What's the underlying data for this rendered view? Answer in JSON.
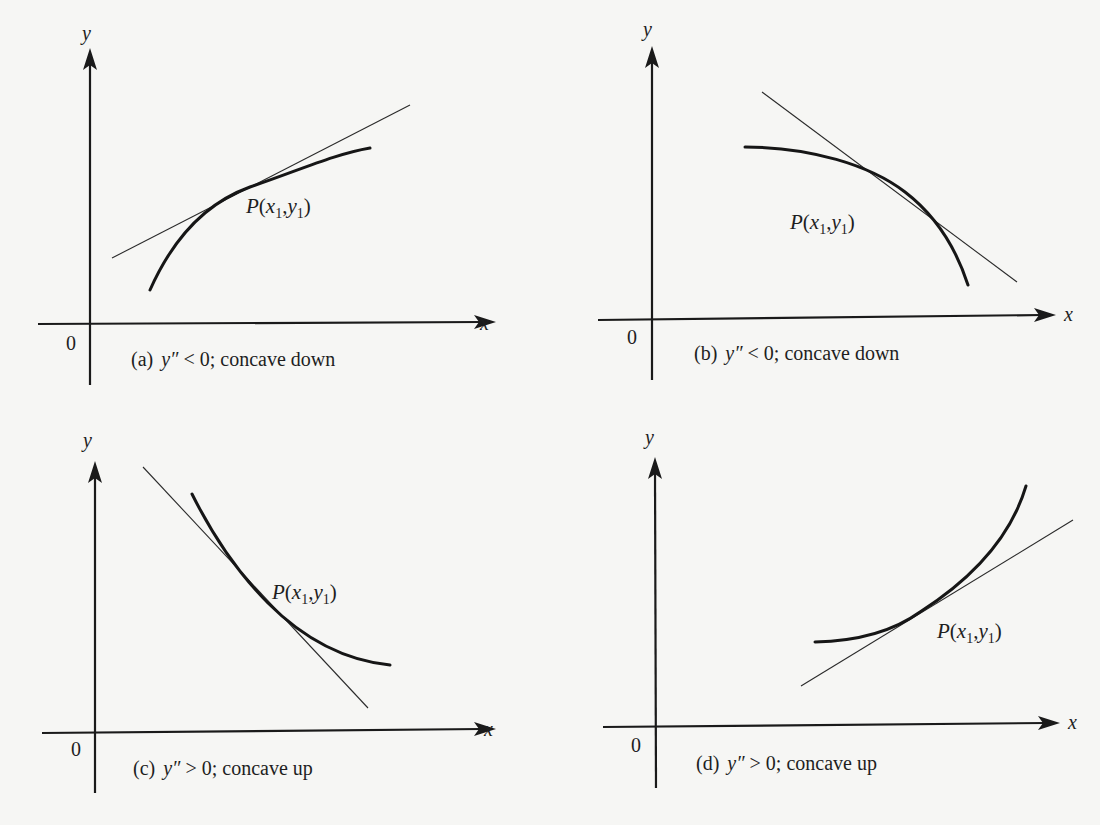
{
  "figure": {
    "panels": [
      {
        "id": "a",
        "axis_x": "x",
        "axis_y": "y",
        "origin": "0",
        "point_label": {
          "P": "P",
          "open": "(",
          "x": "x",
          "x_sub": "1",
          "comma": ",",
          "y": "y",
          "y_sub": "1",
          "close": ")"
        },
        "caption": {
          "tag": "(a)",
          "expr_var": "y″",
          "relation": " < 0; ",
          "description": "concave down"
        }
      },
      {
        "id": "b",
        "axis_x": "x",
        "axis_y": "y",
        "origin": "0",
        "point_label": {
          "P": "P",
          "open": "(",
          "x": "x",
          "x_sub": "1",
          "comma": ",",
          "y": "y",
          "y_sub": "1",
          "close": ")"
        },
        "caption": {
          "tag": "(b)",
          "expr_var": "y″",
          "relation": " < 0; ",
          "description": "concave down"
        }
      },
      {
        "id": "c",
        "axis_x": "x",
        "axis_y": "y",
        "origin": "0",
        "point_label": {
          "P": "P",
          "open": "(",
          "x": "x",
          "x_sub": "1",
          "comma": ",",
          "y": "y",
          "y_sub": "1",
          "close": ")"
        },
        "caption": {
          "tag": "(c)",
          "expr_var": "y″",
          "relation": " > 0; ",
          "description": "concave up"
        }
      },
      {
        "id": "d",
        "axis_x": "x",
        "axis_y": "y",
        "origin": "0",
        "point_label": {
          "P": "P",
          "open": "(",
          "x": "x",
          "x_sub": "1",
          "comma": ",",
          "y": "y",
          "y_sub": "1",
          "close": ")"
        },
        "caption": {
          "tag": "(d)",
          "expr_var": "y″",
          "relation": " > 0; ",
          "description": "concave up"
        }
      }
    ]
  }
}
